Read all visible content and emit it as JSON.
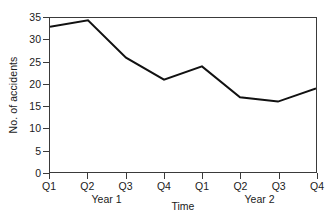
{
  "chart_data": {
    "type": "line",
    "title": "",
    "xlabel": "Time",
    "ylabel": "No. of accidents",
    "categories": [
      "Q1",
      "Q2",
      "Q3",
      "Q4",
      "Q1",
      "Q2",
      "Q3",
      "Q4"
    ],
    "group_labels": [
      "Year 1",
      "Year 2"
    ],
    "values": [
      33,
      34.5,
      26,
      21,
      24,
      17,
      16,
      19
    ],
    "series": [
      {
        "name": "No. of accidents",
        "values": [
          33,
          34.5,
          26,
          21,
          24,
          17,
          16,
          19
        ]
      }
    ],
    "ylim": [
      0,
      35
    ],
    "yticks": [
      0,
      5,
      10,
      15,
      20,
      25,
      30,
      35
    ],
    "ytick_labels": [
      "0",
      "5",
      "10",
      "15",
      "20",
      "25",
      "30",
      "35"
    ],
    "grid": false,
    "legend": false,
    "legend_position": "none",
    "line_color": "#111111",
    "frame_color": "#3a3a3a",
    "background": "#ffffff"
  }
}
